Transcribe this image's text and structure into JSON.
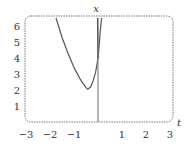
{
  "chart_data": {
    "type": "line",
    "title": "",
    "xlabel": "t",
    "ylabel": "x",
    "xlim": [
      -3,
      3
    ],
    "ylim": [
      0,
      6.5
    ],
    "x_ticks": [
      "-3",
      "-2",
      "-1",
      "1",
      "2",
      "3"
    ],
    "y_ticks": [
      "1",
      "2",
      "3",
      "4",
      "5",
      "6"
    ],
    "grid": false,
    "legend": null,
    "frame": "dashed rounded box",
    "series": [
      {
        "name": "solution curve",
        "color": "#555555",
        "t": [
          -1.75,
          -1.5,
          -1.25,
          -1.0,
          -0.75,
          -0.5,
          -0.42,
          -0.3,
          -0.2,
          -0.1,
          0.0,
          0.05,
          0.1,
          0.15
        ],
        "x": [
          6.5,
          5.3,
          4.3,
          3.4,
          2.7,
          2.15,
          2.05,
          2.2,
          2.6,
          3.1,
          4.0,
          4.8,
          5.8,
          6.5
        ]
      },
      {
        "name": "vertical line",
        "color": "#888888",
        "t": [
          0.0,
          0.0
        ],
        "x": [
          0.0,
          6.5
        ]
      },
      {
        "name": "steep line",
        "color": "#555555",
        "t": [
          -0.02,
          0.0
        ],
        "x": [
          6.5,
          4.0
        ]
      }
    ]
  }
}
